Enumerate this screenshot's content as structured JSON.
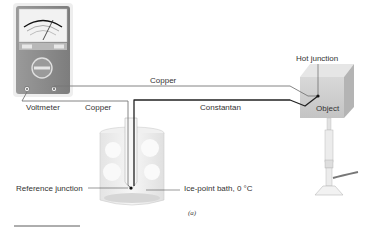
{
  "diagram": {
    "labels": {
      "voltmeter": "Voltmeter",
      "copper_top": "Copper",
      "copper_left": "Copper",
      "constantan": "Constantan",
      "hot_junction": "Hot junction",
      "object": "Object",
      "reference_junction": "Reference junction",
      "ice_bath": "Ice-point bath, 0 °C",
      "caption": "(a)"
    },
    "components": [
      {
        "id": "voltmeter",
        "type": "analog-meter"
      },
      {
        "id": "object",
        "type": "heated-block"
      },
      {
        "id": "burner",
        "type": "bunsen-burner"
      },
      {
        "id": "ice-bath",
        "type": "beaker-with-ice"
      },
      {
        "id": "reference-junction",
        "type": "junction-point"
      },
      {
        "id": "hot-junction",
        "type": "junction-point"
      }
    ],
    "wires": [
      {
        "name": "Copper",
        "from": "voltmeter-right-terminal",
        "to": "hot-junction"
      },
      {
        "name": "Copper",
        "from": "voltmeter-left-terminal",
        "to": "reference-junction"
      },
      {
        "name": "Constantan",
        "from": "reference-junction",
        "to": "hot-junction"
      }
    ],
    "colors": {
      "wire_copper": "#777777",
      "wire_constantan": "#222222",
      "meter_body": "#8a8a8a",
      "object_face": "#cfcfcf"
    }
  }
}
